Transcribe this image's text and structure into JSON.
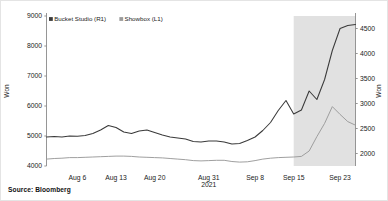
{
  "source_note": "Source: Bloomberg",
  "legend": {
    "items": [
      {
        "label": "Bucket Studio (R1)",
        "color": "#3a3a3a",
        "marker": "square-marker"
      },
      {
        "label": "Showbox (L1)",
        "color": "#9a9a9a",
        "marker": "square-marker"
      }
    ]
  },
  "axes": {
    "left": {
      "title": "Won",
      "ticks": [
        "4000",
        "5000",
        "6000",
        "7000",
        "8000",
        "9000"
      ],
      "min": 4000,
      "max": 9000,
      "step": 1000
    },
    "right": {
      "title": "Won",
      "ticks": [
        "2000",
        "2500",
        "3000",
        "3500",
        "4000",
        "4500"
      ],
      "min": 1750,
      "max": 4750,
      "step": 500
    },
    "x": {
      "ticks": [
        "Aug 6",
        "Aug 13",
        "Aug 20",
        "Aug 31",
        "Sep 8",
        "Sep 15",
        "Sep 23"
      ],
      "year_label": "2021"
    }
  },
  "shaded_region": {
    "color": "#cfcfcf",
    "start_label": "Sep 15",
    "end_label": "Sep 23"
  },
  "chart_data": {
    "type": "line",
    "title": "",
    "subtitle": "",
    "xlabel": "",
    "ylabel": "Won",
    "y2label": "Won",
    "grid": false,
    "legend_position": "top-left",
    "x_tick_labels": [
      "Aug 6",
      "Aug 13",
      "Aug 20",
      "Aug 31",
      "Sep 8",
      "Sep 15",
      "Sep 23"
    ],
    "x_tick_index": [
      4,
      9,
      14,
      21,
      27,
      32,
      38
    ],
    "ylim": [
      4000,
      9000
    ],
    "y2lim": [
      1750,
      4750
    ],
    "annotations": [
      "2021",
      "Source: Bloomberg"
    ],
    "shaded_x_range": [
      32,
      40
    ],
    "series": [
      {
        "name": "Bucket Studio (R1)",
        "axis": "right",
        "color": "#3a3a3a",
        "values": [
          2330,
          2340,
          2330,
          2350,
          2345,
          2360,
          2400,
          2470,
          2560,
          2520,
          2430,
          2400,
          2450,
          2470,
          2420,
          2370,
          2330,
          2310,
          2290,
          2240,
          2230,
          2250,
          2250,
          2230,
          2190,
          2200,
          2260,
          2330,
          2460,
          2620,
          2860,
          3060,
          2790,
          2870,
          3250,
          3080,
          3480,
          4060,
          4500,
          4560,
          4580
        ]
      },
      {
        "name": "Showbox (L1)",
        "axis": "left",
        "color": "#9a9a9a",
        "values": [
          4230,
          4250,
          4260,
          4280,
          4280,
          4290,
          4300,
          4310,
          4320,
          4330,
          4330,
          4320,
          4300,
          4290,
          4280,
          4270,
          4250,
          4230,
          4210,
          4180,
          4170,
          4180,
          4190,
          4190,
          4150,
          4130,
          4140,
          4180,
          4230,
          4260,
          4280,
          4290,
          4300,
          4320,
          4500,
          4980,
          5420,
          5980,
          5720,
          5480,
          5360
        ]
      }
    ]
  }
}
